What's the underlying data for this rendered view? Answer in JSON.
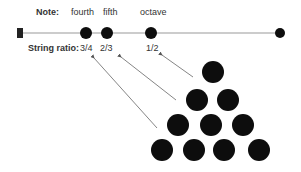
{
  "labels": {
    "note_title": "Note:",
    "ratio_title": "String ratio:"
  },
  "notes": [
    {
      "name": "fourth",
      "ratio": "3/4"
    },
    {
      "name": "fifth",
      "ratio": "2/3"
    },
    {
      "name": "octave",
      "ratio": "1/2"
    }
  ],
  "colors": {
    "dot": "#0d0d0d",
    "string": "#999999",
    "arrow": "#666666",
    "text": "#333333"
  },
  "triangle_rows": [
    1,
    2,
    3,
    4
  ]
}
